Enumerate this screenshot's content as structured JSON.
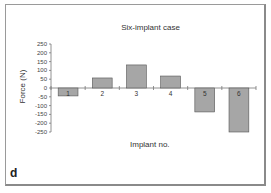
{
  "panel": {
    "label": "d"
  },
  "chart_data": {
    "type": "bar",
    "title": "Six-implant case",
    "xlabel": "Implant no.",
    "ylabel": "Force (N)",
    "categories": [
      "1",
      "2",
      "3",
      "4",
      "5",
      "6"
    ],
    "values": [
      -45,
      57,
      131,
      68,
      -136,
      -250
    ],
    "ylim": [
      -250,
      250
    ],
    "yticks": [
      250,
      200,
      150,
      100,
      50,
      0,
      -50,
      -100,
      -150,
      -200,
      -250
    ],
    "grid": false,
    "legend": null,
    "bar_color": "#a6a6a6"
  }
}
